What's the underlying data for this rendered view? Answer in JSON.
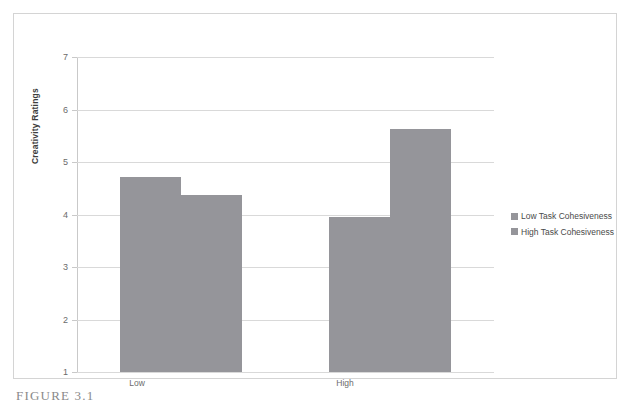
{
  "figure": {
    "caption": "FIGURE 3.1"
  },
  "legend": {
    "position": "right",
    "items": [
      {
        "label": "Low Task Cohesiveness",
        "color": "#95959a"
      },
      {
        "label": "High Task Cohesiveness",
        "color": "#95959a"
      }
    ]
  },
  "axes": {
    "y_title": "Creativity Ratings",
    "y_ticks": [
      "7",
      "6",
      "5",
      "4",
      "3",
      "2",
      "1"
    ],
    "x_categories": [
      "Low",
      "High"
    ]
  },
  "chart_data": {
    "type": "bar",
    "title": "",
    "subtitle": "",
    "xlabel": "",
    "ylabel": "Creativity Ratings",
    "categories": [
      "Low",
      "High"
    ],
    "series": [
      {
        "name": "Low Task Cohesiveness",
        "values": [
          4.72,
          3.95
        ],
        "color": "#95959a"
      },
      {
        "name": "High Task Cohesiveness",
        "values": [
          4.38,
          5.63
        ],
        "color": "#95959a"
      }
    ],
    "ylim": [
      1,
      7
    ],
    "ytick_values": [
      1,
      2,
      3,
      4,
      5,
      6,
      7
    ],
    "grid": true,
    "legend_position": "right",
    "annotations": []
  }
}
